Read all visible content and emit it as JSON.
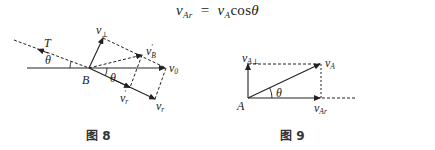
{
  "formula": {
    "lhs_var": "v",
    "lhs_sub": "Ar",
    "equals": "=",
    "rhs_var": "v",
    "rhs_sub": "A",
    "rhs_func": "cos",
    "rhs_angle": "θ"
  },
  "figure8": {
    "caption": "图 8",
    "labels": {
      "T": "T",
      "theta_left": "θ",
      "B": "B",
      "theta_right": "θ",
      "v_perp": "v",
      "v_perp_sub": "⊥",
      "v_B_prime": "v",
      "v_B_prime_sub": "B",
      "v_B_prime_sup": "'",
      "v_0": "v",
      "v_0_sub": "0",
      "v_r_prime": "v",
      "v_r_prime_sub": "r",
      "v_r_prime_sup": "'",
      "v_r": "v",
      "v_r_sub": "r"
    }
  },
  "figure9": {
    "caption": "图 9",
    "labels": {
      "A": "A",
      "theta": "θ",
      "v_A_perp": "v",
      "v_A_perp_sub": "A⊥",
      "v_A": "v",
      "v_A_sub": "A",
      "v_Ar": "v",
      "v_Ar_sub": "Ar"
    }
  },
  "colors": {
    "stroke": "#222222",
    "background": "#ffffff"
  }
}
